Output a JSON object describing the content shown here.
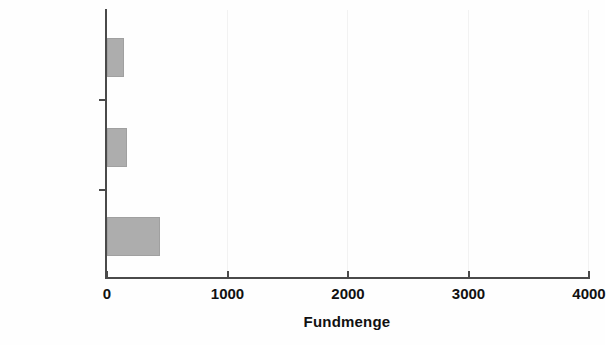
{
  "chart_data": {
    "type": "bar",
    "orientation": "horizontal",
    "title": "",
    "xlabel": "Fundmenge",
    "ylabel": "Plana",
    "categories": [
      "2+3",
      "4+5+6",
      "7+8"
    ],
    "values": [
      140,
      170,
      440
    ],
    "series": [
      {
        "name": "Fundmenge",
        "values": [
          140,
          170,
          440
        ]
      }
    ],
    "xlim": [
      0,
      4000
    ],
    "xticks": [
      0,
      1000,
      2000,
      3000,
      4000
    ],
    "xtick_labels": [
      "0",
      "1000",
      "2000",
      "3000",
      "4000"
    ],
    "grid": true,
    "grid_axis": "x",
    "legend": false,
    "bar_color": "#adadad",
    "axis_color": "#4a4a4a",
    "gridline_color": "#f2f2f2"
  },
  "axes": {
    "y_title": "Plana",
    "x_title": "Fundmenge"
  },
  "ticks": {
    "x": [
      {
        "label": "0",
        "value": 0
      },
      {
        "label": "1000",
        "value": 1000
      },
      {
        "label": "2000",
        "value": 2000
      },
      {
        "label": "3000",
        "value": 3000
      },
      {
        "label": "4000",
        "value": 4000
      }
    ],
    "y": [
      {
        "label": "2+3"
      },
      {
        "label": "4+5+6"
      },
      {
        "label": "7+8"
      }
    ]
  }
}
